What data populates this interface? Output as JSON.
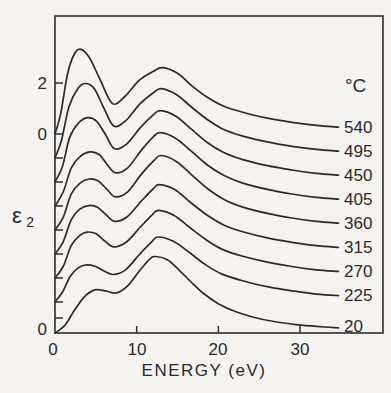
{
  "figure": {
    "y_scale_labels": {
      "two": "2",
      "zero_top": "0",
      "zero_bottom": "0"
    },
    "x_tick_labels": [
      "0",
      "10",
      "20",
      "30"
    ],
    "x_axis_label": "ENERGY (eV)",
    "y_axis_label": {
      "base": "ε",
      "subscript": "2"
    },
    "temperature_unit_header": "°C"
  },
  "chart_data": {
    "type": "line",
    "xlabel": "ENERGY (eV)",
    "ylabel": "epsilon_2",
    "x_ticks_eV": [
      0,
      10,
      20,
      30
    ],
    "x_range_eV": [
      0,
      40
    ],
    "y_reference_ticks": [
      0,
      2
    ],
    "temperature_unit": "°C",
    "presentation": "stacked spectra, each curve vertically offset; small tick on left axis marks the zero of each curve",
    "series": [
      {
        "label": "540",
        "temperature_C": 540,
        "baseline_y_px": 134,
        "points_eV_eps2": [
          [
            0,
            0
          ],
          [
            0.7,
            0.8
          ],
          [
            1.5,
            2.3
          ],
          [
            2.3,
            3.1
          ],
          [
            3.1,
            3.33
          ],
          [
            4.2,
            3.0
          ],
          [
            5.5,
            2.15
          ],
          [
            7.0,
            1.2
          ],
          [
            8.5,
            1.45
          ],
          [
            10.3,
            2.1
          ],
          [
            12.0,
            2.45
          ],
          [
            13.2,
            2.6
          ],
          [
            15.0,
            2.38
          ],
          [
            16.8,
            1.88
          ],
          [
            18.6,
            1.45
          ],
          [
            20.6,
            1.1
          ],
          [
            23.0,
            0.85
          ],
          [
            26.0,
            0.62
          ],
          [
            29.0,
            0.46
          ],
          [
            32.0,
            0.34
          ],
          [
            34.7,
            0.27
          ]
        ]
      },
      {
        "label": "495",
        "temperature_C": 495,
        "baseline_y_px": 158,
        "points_eV_eps2": [
          [
            0,
            0
          ],
          [
            0.8,
            0.7
          ],
          [
            1.7,
            2.0
          ],
          [
            2.8,
            2.72
          ],
          [
            3.7,
            2.92
          ],
          [
            4.8,
            2.72
          ],
          [
            6.0,
            1.95
          ],
          [
            7.2,
            1.25
          ],
          [
            8.7,
            1.48
          ],
          [
            10.4,
            2.12
          ],
          [
            12.0,
            2.55
          ],
          [
            13.0,
            2.72
          ],
          [
            14.8,
            2.5
          ],
          [
            16.7,
            2.0
          ],
          [
            18.6,
            1.52
          ],
          [
            20.6,
            1.13
          ],
          [
            23.0,
            0.86
          ],
          [
            26.0,
            0.63
          ],
          [
            29.0,
            0.46
          ],
          [
            32.0,
            0.34
          ],
          [
            34.7,
            0.27
          ]
        ]
      },
      {
        "label": "450",
        "temperature_C": 450,
        "baseline_y_px": 182,
        "points_eV_eps2": [
          [
            0,
            0
          ],
          [
            0.9,
            0.6
          ],
          [
            1.8,
            1.75
          ],
          [
            2.9,
            2.32
          ],
          [
            4.0,
            2.52
          ],
          [
            5.1,
            2.38
          ],
          [
            6.2,
            1.85
          ],
          [
            7.3,
            1.3
          ],
          [
            8.8,
            1.5
          ],
          [
            10.5,
            2.15
          ],
          [
            12.0,
            2.62
          ],
          [
            12.9,
            2.8
          ],
          [
            14.8,
            2.58
          ],
          [
            16.7,
            2.07
          ],
          [
            18.6,
            1.56
          ],
          [
            20.6,
            1.17
          ],
          [
            23.0,
            0.88
          ],
          [
            26.0,
            0.64
          ],
          [
            29.0,
            0.47
          ],
          [
            32.0,
            0.34
          ],
          [
            34.7,
            0.27
          ]
        ]
      },
      {
        "label": "405",
        "temperature_C": 405,
        "baseline_y_px": 206,
        "points_eV_eps2": [
          [
            0,
            0
          ],
          [
            1.0,
            0.55
          ],
          [
            2.0,
            1.5
          ],
          [
            3.1,
            1.95
          ],
          [
            4.3,
            2.12
          ],
          [
            5.4,
            2.02
          ],
          [
            6.4,
            1.62
          ],
          [
            7.4,
            1.3
          ],
          [
            8.9,
            1.5
          ],
          [
            10.6,
            2.2
          ],
          [
            12.0,
            2.7
          ],
          [
            12.9,
            2.88
          ],
          [
            14.8,
            2.65
          ],
          [
            16.8,
            2.12
          ],
          [
            18.7,
            1.6
          ],
          [
            20.7,
            1.2
          ],
          [
            23.0,
            0.9
          ],
          [
            26.0,
            0.65
          ],
          [
            29.0,
            0.47
          ],
          [
            32.0,
            0.34
          ],
          [
            34.7,
            0.27
          ]
        ]
      },
      {
        "label": "360",
        "temperature_C": 360,
        "baseline_y_px": 230,
        "points_eV_eps2": [
          [
            0,
            0
          ],
          [
            1.0,
            0.5
          ],
          [
            2.0,
            1.42
          ],
          [
            3.1,
            1.85
          ],
          [
            4.2,
            2.0
          ],
          [
            5.3,
            1.92
          ],
          [
            6.4,
            1.58
          ],
          [
            7.4,
            1.3
          ],
          [
            8.9,
            1.5
          ],
          [
            10.6,
            2.2
          ],
          [
            12.1,
            2.72
          ],
          [
            13.0,
            2.92
          ],
          [
            14.9,
            2.68
          ],
          [
            16.8,
            2.14
          ],
          [
            18.7,
            1.62
          ],
          [
            20.7,
            1.2
          ],
          [
            23.0,
            0.9
          ],
          [
            26.0,
            0.65
          ],
          [
            29.0,
            0.47
          ],
          [
            32.0,
            0.34
          ],
          [
            34.7,
            0.27
          ]
        ]
      },
      {
        "label": "315",
        "temperature_C": 315,
        "baseline_y_px": 254,
        "points_eV_eps2": [
          [
            0,
            0
          ],
          [
            1.0,
            0.48
          ],
          [
            2.0,
            1.35
          ],
          [
            3.0,
            1.75
          ],
          [
            4.1,
            1.9
          ],
          [
            5.2,
            1.83
          ],
          [
            6.3,
            1.52
          ],
          [
            7.3,
            1.28
          ],
          [
            8.8,
            1.45
          ],
          [
            10.5,
            2.05
          ],
          [
            12.0,
            2.55
          ],
          [
            12.8,
            2.72
          ],
          [
            14.7,
            2.52
          ],
          [
            16.6,
            2.02
          ],
          [
            18.6,
            1.53
          ],
          [
            20.6,
            1.15
          ],
          [
            23.0,
            0.87
          ],
          [
            26.0,
            0.63
          ],
          [
            29.0,
            0.46
          ],
          [
            32.0,
            0.33
          ],
          [
            34.7,
            0.26
          ]
        ]
      },
      {
        "label": "270",
        "temperature_C": 270,
        "baseline_y_px": 278,
        "points_eV_eps2": [
          [
            0,
            0
          ],
          [
            1.0,
            0.45
          ],
          [
            2.0,
            1.28
          ],
          [
            3.0,
            1.66
          ],
          [
            3.9,
            1.8
          ],
          [
            5.0,
            1.74
          ],
          [
            6.1,
            1.45
          ],
          [
            7.2,
            1.22
          ],
          [
            8.7,
            1.4
          ],
          [
            10.4,
            1.98
          ],
          [
            11.9,
            2.48
          ],
          [
            12.7,
            2.65
          ],
          [
            14.6,
            2.45
          ],
          [
            16.5,
            1.98
          ],
          [
            18.5,
            1.5
          ],
          [
            20.5,
            1.12
          ],
          [
            23.0,
            0.85
          ],
          [
            26.0,
            0.62
          ],
          [
            29.0,
            0.45
          ],
          [
            32.0,
            0.32
          ],
          [
            34.7,
            0.26
          ]
        ]
      },
      {
        "label": "225",
        "temperature_C": 225,
        "baseline_y_px": 302,
        "points_eV_eps2": [
          [
            0,
            0
          ],
          [
            0.9,
            0.38
          ],
          [
            1.9,
            1.02
          ],
          [
            2.8,
            1.33
          ],
          [
            3.7,
            1.45
          ],
          [
            4.9,
            1.4
          ],
          [
            6.0,
            1.22
          ],
          [
            7.1,
            1.08
          ],
          [
            8.6,
            1.25
          ],
          [
            10.3,
            1.85
          ],
          [
            11.8,
            2.35
          ],
          [
            12.6,
            2.55
          ],
          [
            14.5,
            2.38
          ],
          [
            16.5,
            1.93
          ],
          [
            18.4,
            1.47
          ],
          [
            20.4,
            1.1
          ],
          [
            23.0,
            0.83
          ],
          [
            26.0,
            0.6
          ],
          [
            29.0,
            0.44
          ],
          [
            32.0,
            0.31
          ],
          [
            34.7,
            0.25
          ]
        ]
      },
      {
        "label": "20",
        "temperature_C": 20,
        "baseline_y_px": 333,
        "points_eV_eps2": [
          [
            0,
            0
          ],
          [
            1.2,
            0.3
          ],
          [
            2.4,
            0.9
          ],
          [
            3.6,
            1.42
          ],
          [
            4.9,
            1.69
          ],
          [
            6.2,
            1.65
          ],
          [
            7.5,
            1.57
          ],
          [
            8.9,
            1.85
          ],
          [
            10.3,
            2.42
          ],
          [
            11.6,
            2.9
          ],
          [
            12.3,
            3.0
          ],
          [
            13.7,
            2.88
          ],
          [
            15.1,
            2.5
          ],
          [
            16.6,
            2.02
          ],
          [
            18.2,
            1.55
          ],
          [
            20.0,
            1.15
          ],
          [
            22.0,
            0.85
          ],
          [
            24.3,
            0.62
          ],
          [
            26.8,
            0.45
          ],
          [
            29.5,
            0.33
          ],
          [
            32.0,
            0.26
          ],
          [
            34.7,
            0.2
          ]
        ]
      }
    ],
    "layout_hints": {
      "frame": {
        "left": 55,
        "top": 16,
        "right": 383,
        "bottom": 333
      },
      "px_per_eV": 8.167,
      "px_per_eps2_unit": 25.5,
      "y_scale_tick_y_px": {
        "two": 83,
        "zero_top": 134
      },
      "extra_left_ticks_y_px": [
        318
      ],
      "temp_label_x_px": 344,
      "tick_length_px": 8
    }
  }
}
